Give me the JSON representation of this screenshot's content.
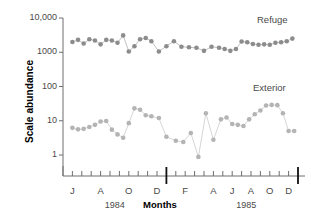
{
  "chart_data": {
    "type": "scatter",
    "title": "",
    "xlabel": "Months",
    "ylabel": "Scale abundance",
    "yscale": "log",
    "ylim": [
      0.45,
      14000
    ],
    "ytick_labels": [
      "10,000",
      "1000",
      "100",
      "10",
      "1"
    ],
    "ytick_values": [
      10000,
      1000,
      100,
      10,
      1
    ],
    "grid": false,
    "legend_position": "inline-annotation",
    "xlim": [
      0,
      25
    ],
    "x_tick_count": 25,
    "x_tick_labels": [
      {
        "index": 1,
        "label": "J"
      },
      {
        "index": 4,
        "label": "A"
      },
      {
        "index": 7,
        "label": "O"
      },
      {
        "index": 10,
        "label": "D"
      },
      {
        "index": 13,
        "label": "F"
      },
      {
        "index": 16,
        "label": "A"
      },
      {
        "index": 18,
        "label": "J"
      },
      {
        "index": 20,
        "label": "A"
      },
      {
        "index": 22,
        "label": "O"
      },
      {
        "index": 24,
        "label": "D"
      }
    ],
    "year_labels": [
      {
        "text": "1984",
        "index": 5.5
      },
      {
        "text": "1985",
        "index": 19.5
      }
    ],
    "year_divider_index": 11,
    "series": [
      {
        "name": "Refuge",
        "color": "#8c8c8c",
        "line_color": "#c2c2c2",
        "annotation": "Refuge",
        "x": [
          1,
          1.6,
          2.2,
          2.8,
          3.4,
          4.0,
          4.6,
          5.2,
          5.8,
          6.4,
          7.0,
          7.6,
          8.2,
          8.8,
          9.4,
          10.2,
          11.0,
          11.8,
          12.6,
          13.4,
          14.2,
          15.0,
          15.8,
          16.6,
          17.2,
          17.8,
          18.4,
          19.0,
          19.6,
          20.2,
          20.8,
          21.4,
          22.0,
          22.6,
          23.2,
          23.8,
          24.4
        ],
        "values": [
          2000,
          2300,
          1800,
          2400,
          2200,
          1700,
          2300,
          2200,
          1900,
          3100,
          1050,
          1500,
          2400,
          2600,
          2100,
          1050,
          1500,
          2100,
          1450,
          1400,
          1350,
          1100,
          1450,
          1350,
          1250,
          1100,
          1250,
          2050,
          1950,
          1750,
          1650,
          1700,
          1650,
          1900,
          1950,
          2100,
          2500
        ]
      },
      {
        "name": "Exterior",
        "color": "#b4b4b4",
        "line_color": "#d6d6d6",
        "annotation": "Exterior",
        "x": [
          1,
          1.6,
          2.2,
          2.8,
          3.4,
          4.0,
          4.6,
          5.2,
          5.8,
          6.4,
          7.0,
          7.6,
          8.2,
          8.8,
          9.4,
          10.2,
          11.0,
          12.0,
          12.8,
          13.6,
          14.4,
          15.2,
          16.0,
          16.8,
          17.4,
          18.0,
          18.6,
          19.2,
          19.8,
          20.4,
          21.0,
          21.6,
          22.2,
          22.8,
          23.4,
          24.0,
          24.6
        ],
        "values": [
          6.2,
          5.6,
          5.8,
          6.6,
          7.6,
          9.5,
          9.8,
          5.5,
          4.0,
          3.2,
          8.5,
          23,
          21,
          14.5,
          13.5,
          12,
          3.4,
          2.6,
          2.4,
          4.4,
          0.88,
          16.5,
          2.8,
          11,
          12.5,
          8.0,
          7.6,
          7.0,
          11.0,
          15.5,
          20,
          28,
          29,
          28.5,
          16.5,
          5.0,
          5.0
        ]
      }
    ],
    "refuge_annot_pos": {
      "x": 257,
      "y": 14
    },
    "exterior_annot_pos": {
      "x": 253,
      "y": 82
    }
  },
  "axes": {
    "plot_left": 63,
    "plot_right": 298,
    "plot_top": 18,
    "plot_bottom": 176,
    "axis_color": "#6e6e6e"
  }
}
